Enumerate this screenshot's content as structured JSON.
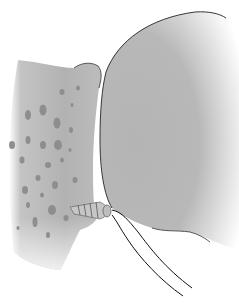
{
  "illustration": {
    "subject": "suture anchor in bone adjacent to humeral head",
    "colors": {
      "background": "#ffffff",
      "bone": "#b4b4b4",
      "bone_light": "#d2d2d2",
      "head": "#b8b8b8",
      "outline": "#1e1e1e",
      "pores": "#8c8c8c",
      "anchor": "#c8c8c8"
    }
  }
}
